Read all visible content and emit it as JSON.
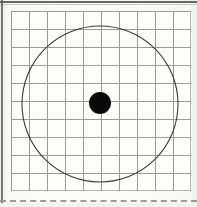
{
  "figure": {
    "media": "scanned-paper",
    "width_px": 197,
    "height_px": 207,
    "paper_color": "#fbfbf9",
    "ink_color": "#333333"
  },
  "grid": {
    "name": "square-ruled-grid",
    "columns": 10,
    "rows": 10,
    "cell_size_px": 18,
    "left_px": 11,
    "top_px": 11,
    "width_px": 180,
    "height_px": 180,
    "line_color": "#9a9a9a",
    "line_width_px": 0.7,
    "fill_color": "#fdfdfc"
  },
  "circle": {
    "name": "circle-outline",
    "center_x_px": 100,
    "center_y_px": 104,
    "radius_px": 78,
    "radius_cells": 4.33,
    "stroke_color": "#3a3a3a",
    "stroke_width_px": 1.1,
    "fill": "none"
  },
  "center_dot": {
    "name": "center-dot",
    "center_x_px": 100,
    "center_y_px": 103,
    "radius_px": 11,
    "diameter_px": 22,
    "fill_color": "#0a0a0a"
  },
  "edges": {
    "top_rule_color": "#4e4e4e",
    "left_rule_color": "#5a5a5a",
    "dashed_rule_color": "#9b9b99",
    "dashed_rule_top_px": 200,
    "dashed_rule_style": "dashed"
  },
  "chart_data": {
    "type": "scatter",
    "title": "",
    "xlabel": "",
    "ylabel": "",
    "xlim": [
      0,
      10
    ],
    "ylim": [
      0,
      10
    ],
    "grid": true,
    "legend": "none",
    "series": [
      {
        "name": "circle-outline",
        "shape": "circle",
        "cx": 4.94,
        "cy": 4.83,
        "r": 4.33,
        "filled": false
      },
      {
        "name": "center-dot",
        "shape": "circle",
        "cx": 4.94,
        "cy": 4.89,
        "r": 0.61,
        "filled": true
      }
    ]
  }
}
